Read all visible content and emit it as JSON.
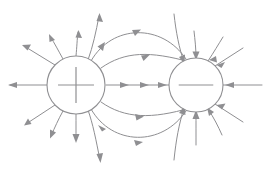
{
  "diagram": {
    "title": "Electric dipole field lines",
    "background_color": "#ffffff",
    "line_color": "#8f8f92",
    "width": 272,
    "height": 181,
    "charges": [
      {
        "id": "positive-charge",
        "label": "+",
        "sign": "positive",
        "cx": 76,
        "cy": 85,
        "r": 29,
        "sign_label_name": "plus-sign"
      },
      {
        "id": "negative-charge",
        "label": "−",
        "sign": "negative",
        "cx": 196,
        "cy": 85,
        "r": 27,
        "sign_label_name": "minus-sign"
      }
    ],
    "axis_line": {
      "name": "central-axis-field-line",
      "from_x": 106,
      "to_x": 168,
      "y": 85,
      "arrow_count": 3,
      "direction": "right"
    },
    "inner_arcs": [
      {
        "name": "field-arc-upper-inner",
        "sweep": "up",
        "bulge": 30,
        "arrows": 1
      },
      {
        "name": "field-arc-upper-outer",
        "sweep": "up",
        "bulge": 56,
        "arrows": 2
      },
      {
        "name": "field-arc-lower-inner",
        "sweep": "down",
        "bulge": 30,
        "arrows": 1
      },
      {
        "name": "field-arc-lower-outer",
        "sweep": "down",
        "bulge": 56,
        "arrows": 2
      }
    ],
    "outer_rays_positive": 9,
    "outer_rays_negative": 9,
    "arrow_direction_positive": "outward",
    "arrow_direction_negative": "inward"
  }
}
